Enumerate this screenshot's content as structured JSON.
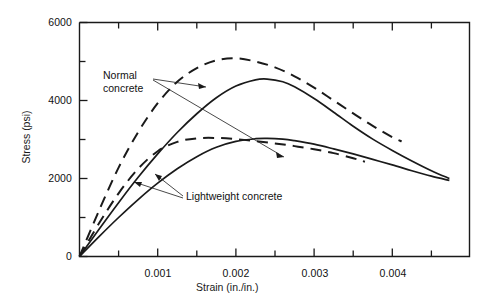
{
  "chart_data": {
    "type": "line",
    "title": "",
    "xlabel": "Strain (in./in.)",
    "ylabel": "Stress (psi)",
    "xlim": [
      0,
      0.00498
    ],
    "ylim": [
      0,
      6000
    ],
    "grid": false,
    "legend_position": "inline-annotations",
    "x_ticks_major": [
      0.001,
      0.002,
      0.003,
      0.004
    ],
    "x_tick_labels": [
      "0.001",
      "0.002",
      "0.003",
      "0.004"
    ],
    "x_ticks_minor": [
      0.0005,
      0.0015,
      0.0025,
      0.0035,
      0.0045
    ],
    "y_ticks_major": [
      0,
      2000,
      4000,
      6000
    ],
    "y_tick_labels": [
      "0",
      "2000",
      "4000",
      "6000"
    ],
    "y_ticks_minor": [
      1000,
      3000,
      5000
    ],
    "annotations": [
      {
        "name": "normal-concrete",
        "text": "Normal\nconcrete",
        "x": 0.00029,
        "y": 4800
      },
      {
        "name": "lightweight-concrete",
        "text": "Lightweight concrete",
        "x": 0.00137,
        "y": 1570
      }
    ],
    "series": [
      {
        "name": "Normal concrete (high strength)",
        "style": "dashed",
        "points": [
          [
            0.0,
            0
          ],
          [
            0.00025,
            1180
          ],
          [
            0.0005,
            2280
          ],
          [
            0.00075,
            3190
          ],
          [
            0.001,
            3930
          ],
          [
            0.00125,
            4480
          ],
          [
            0.0015,
            4830
          ],
          [
            0.00175,
            5030
          ],
          [
            0.002,
            5080
          ],
          [
            0.00225,
            5000
          ],
          [
            0.0025,
            4850
          ],
          [
            0.00275,
            4620
          ],
          [
            0.003,
            4330
          ],
          [
            0.00325,
            4000
          ],
          [
            0.0035,
            3670
          ],
          [
            0.00375,
            3350
          ],
          [
            0.004,
            3060
          ],
          [
            0.00412,
            2950
          ]
        ]
      },
      {
        "name": "Lightweight concrete (high strength)",
        "style": "solid",
        "points": [
          [
            0.0,
            0
          ],
          [
            0.00025,
            700
          ],
          [
            0.0005,
            1380
          ],
          [
            0.00075,
            2030
          ],
          [
            0.001,
            2630
          ],
          [
            0.00125,
            3180
          ],
          [
            0.0015,
            3660
          ],
          [
            0.00175,
            4070
          ],
          [
            0.002,
            4370
          ],
          [
            0.00225,
            4530
          ],
          [
            0.0024,
            4550
          ],
          [
            0.0026,
            4480
          ],
          [
            0.00275,
            4350
          ],
          [
            0.003,
            4050
          ],
          [
            0.00325,
            3700
          ],
          [
            0.0035,
            3340
          ],
          [
            0.00375,
            3010
          ],
          [
            0.004,
            2720
          ],
          [
            0.00425,
            2450
          ],
          [
            0.0045,
            2200
          ],
          [
            0.00473,
            2000
          ]
        ]
      },
      {
        "name": "Normal concrete (low strength)",
        "style": "dashed",
        "points": [
          [
            0.0,
            0
          ],
          [
            0.00025,
            850
          ],
          [
            0.0005,
            1620
          ],
          [
            0.00075,
            2250
          ],
          [
            0.001,
            2700
          ],
          [
            0.00125,
            2940
          ],
          [
            0.0015,
            3030
          ],
          [
            0.00175,
            3040
          ],
          [
            0.002,
            3010
          ],
          [
            0.00225,
            2960
          ],
          [
            0.0025,
            2900
          ],
          [
            0.00275,
            2830
          ],
          [
            0.003,
            2750
          ],
          [
            0.00325,
            2650
          ],
          [
            0.0035,
            2520
          ],
          [
            0.00365,
            2430
          ]
        ]
      },
      {
        "name": "Lightweight concrete (low strength)",
        "style": "solid",
        "points": [
          [
            0.0,
            0
          ],
          [
            0.00025,
            510
          ],
          [
            0.0005,
            1000
          ],
          [
            0.00075,
            1460
          ],
          [
            0.001,
            1880
          ],
          [
            0.00125,
            2250
          ],
          [
            0.0015,
            2560
          ],
          [
            0.00175,
            2800
          ],
          [
            0.002,
            2950
          ],
          [
            0.00225,
            3020
          ],
          [
            0.0024,
            3030
          ],
          [
            0.0026,
            3010
          ],
          [
            0.00275,
            2970
          ],
          [
            0.003,
            2880
          ],
          [
            0.00325,
            2760
          ],
          [
            0.0035,
            2630
          ],
          [
            0.00375,
            2490
          ],
          [
            0.004,
            2350
          ],
          [
            0.00425,
            2200
          ],
          [
            0.0045,
            2060
          ],
          [
            0.00473,
            1950
          ]
        ]
      }
    ]
  }
}
